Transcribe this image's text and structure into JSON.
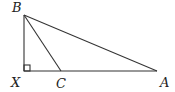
{
  "diagram": {
    "type": "geometry-triangle",
    "stroke_color": "#333333",
    "label_color": "#222222",
    "points": {
      "B": {
        "label": "B",
        "x": 24,
        "y": 15
      },
      "X": {
        "label": "X",
        "x": 24,
        "y": 71
      },
      "C": {
        "label": "C",
        "x": 61,
        "y": 71
      },
      "A": {
        "label": "A",
        "x": 157,
        "y": 71
      }
    },
    "segments": [
      "BX",
      "XA",
      "BA",
      "BC"
    ],
    "right_angle_at": "X"
  }
}
